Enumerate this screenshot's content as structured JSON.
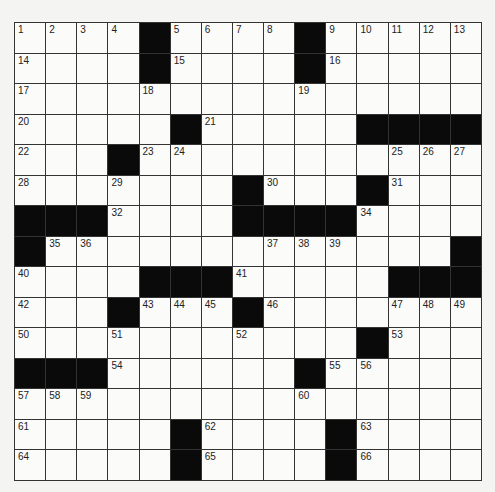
{
  "puzzle": {
    "rows": 15,
    "cols": 15,
    "grid": [
      "....#....#.....",
      "....#....#.....",
      "...............",
      ".....#.....####",
      "...#...........",
      ".......#...#...",
      "###....####....",
      "#.............#",
      "....###.....###",
      "...#...#.......",
      "...........#...",
      "###......#.....",
      "...............",
      ".....#....#....",
      ".....#....#...."
    ],
    "numbers": [
      [
        1,
        2,
        3,
        4,
        0,
        5,
        6,
        7,
        8,
        0,
        9,
        10,
        11,
        12,
        13
      ],
      [
        14,
        0,
        0,
        0,
        0,
        15,
        0,
        0,
        0,
        0,
        16,
        0,
        0,
        0,
        0
      ],
      [
        17,
        0,
        0,
        0,
        18,
        0,
        0,
        0,
        0,
        19,
        0,
        0,
        0,
        0,
        0
      ],
      [
        20,
        0,
        0,
        0,
        0,
        0,
        21,
        0,
        0,
        0,
        0,
        0,
        0,
        0,
        0
      ],
      [
        22,
        0,
        0,
        0,
        23,
        24,
        0,
        0,
        0,
        0,
        0,
        0,
        25,
        26,
        27
      ],
      [
        28,
        0,
        0,
        29,
        0,
        0,
        0,
        0,
        30,
        0,
        0,
        0,
        31,
        0,
        0
      ],
      [
        0,
        0,
        0,
        32,
        0,
        0,
        0,
        33,
        0,
        0,
        0,
        34,
        0,
        0,
        0
      ],
      [
        0,
        35,
        36,
        0,
        0,
        0,
        0,
        0,
        37,
        38,
        39,
        0,
        0,
        0,
        0
      ],
      [
        40,
        0,
        0,
        0,
        0,
        0,
        0,
        41,
        0,
        0,
        0,
        0,
        0,
        0,
        0
      ],
      [
        42,
        0,
        0,
        0,
        43,
        44,
        45,
        0,
        46,
        0,
        0,
        0,
        47,
        48,
        49
      ],
      [
        50,
        0,
        0,
        51,
        0,
        0,
        0,
        52,
        0,
        0,
        0,
        0,
        53,
        0,
        0
      ],
      [
        0,
        0,
        0,
        54,
        0,
        0,
        0,
        0,
        0,
        0,
        55,
        56,
        0,
        0,
        0
      ],
      [
        57,
        58,
        59,
        0,
        0,
        0,
        0,
        0,
        0,
        60,
        0,
        0,
        0,
        0,
        0
      ],
      [
        61,
        0,
        0,
        0,
        0,
        0,
        62,
        0,
        0,
        0,
        0,
        63,
        0,
        0,
        0
      ],
      [
        64,
        0,
        0,
        0,
        0,
        0,
        65,
        0,
        0,
        0,
        0,
        66,
        0,
        0,
        0
      ]
    ]
  },
  "colors": {
    "block": "#0a0a0a",
    "cell": "#fbfbfa",
    "line": "#333333",
    "page": "#f4f4f2"
  }
}
